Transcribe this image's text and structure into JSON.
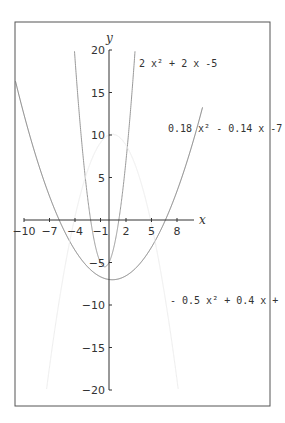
{
  "chart_data": {
    "type": "line",
    "title": "",
    "xlabel": "x",
    "ylabel": "y",
    "xlim": [
      -10,
      10
    ],
    "ylim": [
      -20,
      20
    ],
    "x_ticks": [
      "-10",
      "-7",
      "-4",
      "-1",
      "2",
      "5",
      "8"
    ],
    "y_ticks": [
      "20",
      "15",
      "10",
      "5",
      "-5",
      "-10",
      "-15",
      "-20"
    ],
    "grid": false,
    "series": [
      {
        "name": "2x²+2x-5",
        "label": "2 x² + 2 x -5",
        "a": 2,
        "b": 2,
        "c": -5,
        "color": "#999999"
      },
      {
        "name": "0.18x²-0.14x-7",
        "label": "0.18 x² - 0.14 x -7",
        "a": 0.18,
        "b": -0.14,
        "c": -7,
        "color": "#777777"
      },
      {
        "name": "-0.5x²+0.4x+10",
        "label": "- 0.5 x² + 0.4 x + 10",
        "a": -0.5,
        "b": 0.4,
        "c": 10,
        "color": "#eeeeee"
      }
    ]
  }
}
